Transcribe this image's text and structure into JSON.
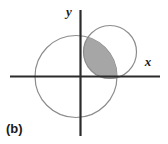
{
  "figure": {
    "panel_label": "(b)",
    "axes": {
      "x_label": "x",
      "y_label": "y",
      "origin": {
        "x": 80.5,
        "y": 76.5
      },
      "x_axis_extent": [
        10,
        160
      ],
      "y_axis_extent": [
        10,
        136
      ],
      "axis_color": "#2b2b2b",
      "axis_width": 2.2
    },
    "curves": [
      {
        "name": "circle-left",
        "type": "circle",
        "center": {
          "x": 76.0,
          "y": 76.5
        },
        "radius": 41.0,
        "stroke": "#8c8c8c",
        "stroke_width": 1.2,
        "fill": "none"
      },
      {
        "name": "circle-right",
        "type": "circle",
        "center": {
          "x": 110.0,
          "y": 52.0
        },
        "radius": 26.5,
        "stroke": "#8c8c8c",
        "stroke_width": 1.2,
        "fill": "none"
      }
    ],
    "shaded_region": {
      "name": "intersection-lens",
      "description": "region common to both circles",
      "fill": "#a6a6a6",
      "stroke": "#8c8c8c",
      "stroke_width": 1.0
    },
    "label_positions": {
      "y_label": {
        "x": 69,
        "y": 16
      },
      "x_label": {
        "x": 148,
        "y": 66
      },
      "panel_label": {
        "x": 6,
        "y": 133
      }
    },
    "colors": {
      "background": "#ffffff",
      "ink": "#1a1a1a",
      "curve": "#8c8c8c",
      "shade": "#a6a6a6"
    }
  },
  "chart_data": {
    "type": "scatter",
    "title": "",
    "xlabel": "x",
    "ylabel": "y",
    "annotations": [
      "(b)"
    ],
    "grid": false,
    "legend": "none",
    "shapes": [
      {
        "name": "circle-left",
        "kind": "circle",
        "center_px": [
          76.0,
          76.5
        ],
        "radius_px": 41.0,
        "filled": false
      },
      {
        "name": "circle-right",
        "kind": "circle",
        "center_px": [
          110.0,
          52.0
        ],
        "radius_px": 26.5,
        "filled": false
      },
      {
        "name": "intersection-lens",
        "kind": "intersection",
        "of": [
          "circle-left",
          "circle-right"
        ],
        "filled": true,
        "fill_color": "#a6a6a6"
      }
    ]
  }
}
